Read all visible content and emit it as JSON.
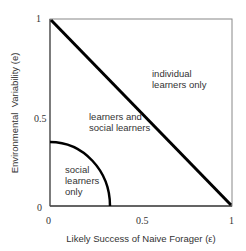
{
  "diagram": {
    "type": "phase-diagram",
    "x_axis": {
      "label": "Likely Success of Naive Forager (ε)",
      "ticks": [
        "0",
        "0.5",
        "1"
      ],
      "range": [
        0,
        1
      ]
    },
    "y_axis": {
      "label": "Environmental  Variability (e)",
      "ticks": [
        "0",
        "0.5",
        "1"
      ],
      "range": [
        0,
        1
      ]
    },
    "regions": {
      "individual": [
        "individual",
        "learners only"
      ],
      "mixed": [
        "learners and",
        "social learners"
      ],
      "social": [
        "social",
        "learners",
        "only"
      ]
    },
    "boundaries": [
      {
        "name": "diagonal",
        "from": [
          0,
          1
        ],
        "to": [
          1,
          0
        ]
      },
      {
        "name": "quarter-arc",
        "x_intercept": 0.33,
        "y_intercept": 0.35
      }
    ],
    "colors": {
      "frame": "#777777",
      "boundary": "#000000",
      "text": "#333333"
    }
  }
}
